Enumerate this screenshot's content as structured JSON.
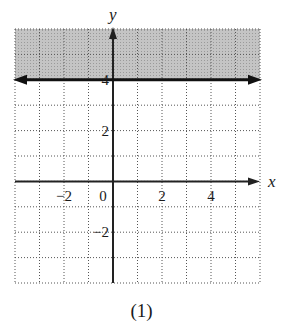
{
  "chart_data": {
    "type": "line",
    "title": "",
    "caption": "(1)",
    "xlabel": "x",
    "ylabel": "y",
    "xlim": [
      -4,
      6
    ],
    "ylim": [
      -4,
      6
    ],
    "grid": true,
    "grid_style": "dotted",
    "x_ticks": [
      -2,
      0,
      2,
      4
    ],
    "x_tick_labels": [
      "−2",
      "0",
      "2",
      "4"
    ],
    "y_ticks": [
      4,
      2,
      -2
    ],
    "y_tick_labels": [
      "4",
      "2",
      "−2"
    ],
    "series": [
      {
        "name": "boundary line y = 4",
        "x": [
          -4,
          6
        ],
        "y": [
          4,
          4
        ],
        "style": "solid, arrows both ends"
      }
    ],
    "shaded_region": {
      "description": "y > 4",
      "y_from": 4,
      "y_to": 6,
      "color": "#bdbdbd"
    },
    "inequality": "y > 4"
  },
  "caption": "(1)",
  "axis_labels": {
    "x": "x",
    "y": "y"
  }
}
